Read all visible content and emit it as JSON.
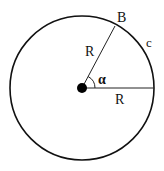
{
  "diagram": {
    "type": "circle-sector",
    "labels": {
      "point_b": "B",
      "arc": "c",
      "radius_upper": "R",
      "radius_lower": "R",
      "angle": "α"
    },
    "colors": {
      "stroke": "#111111",
      "background": "#ffffff"
    }
  }
}
